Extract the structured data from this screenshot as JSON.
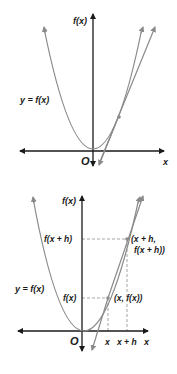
{
  "figure_top": {
    "y_axis_label": "f(x)",
    "x_axis_label": "x",
    "origin_label": "O",
    "curve_label": "y = f(x)",
    "description": "Parabola through origin with a secant line and a tangent line at a point"
  },
  "figure_bottom": {
    "y_axis_label": "f(x)",
    "x_axis_label": "x",
    "origin_label": "O",
    "curve_label": "y = f(x)",
    "y_tick_labels": [
      "f(x + h)",
      "f(x)"
    ],
    "x_tick_labels": [
      "x",
      "x + h"
    ],
    "point_labels": [
      "(x, f(x))",
      "(x + h,",
      "f(x + h))"
    ],
    "description": "Parabola with secant line through (x, f(x)) and (x + h, f(x + h)) plus dashed guide lines"
  },
  "colors": {
    "axis": "#1a1a1a",
    "curve": "#8a8a8a",
    "guides": "#9a9a9a"
  }
}
